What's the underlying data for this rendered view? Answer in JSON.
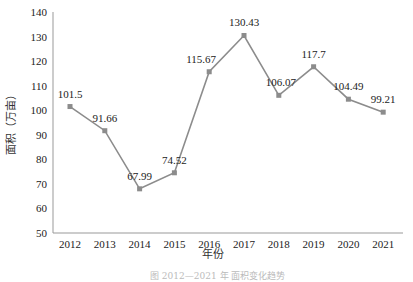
{
  "chart_data": {
    "type": "line",
    "title": "",
    "xlabel": "年份",
    "ylabel": "面积（万亩）",
    "categories": [
      "2012",
      "2013",
      "2014",
      "2015",
      "2016",
      "2017",
      "2018",
      "2019",
      "2020",
      "2021"
    ],
    "series": [
      {
        "name": "面积",
        "values": [
          101.5,
          91.66,
          67.99,
          74.52,
          115.67,
          130.43,
          106.07,
          117.7,
          104.49,
          99.21
        ]
      }
    ],
    "data_labels": [
      "101.5",
      "91.66",
      "67.99",
      "74.52",
      "115.67",
      "130.43",
      "106.07",
      "117.7",
      "104.49",
      "99.21"
    ],
    "ylim": [
      50,
      140
    ],
    "yticks": [
      50,
      60,
      70,
      80,
      90,
      100,
      110,
      120,
      130,
      140
    ],
    "grid": false,
    "legend": "none",
    "line_color": "#8c8c8c",
    "marker": "square"
  },
  "caption": "图 2012—2021 年 面积变化趋势"
}
